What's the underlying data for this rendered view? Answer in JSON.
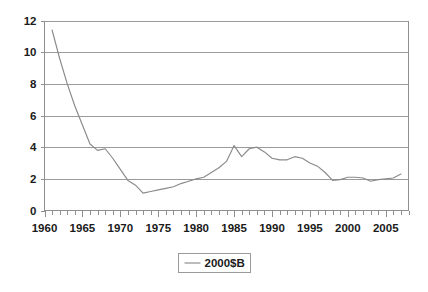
{
  "chart_data": {
    "type": "line",
    "title": "",
    "subtitle": "",
    "xlabel": "",
    "ylabel": "",
    "xlim": [
      1960,
      2008
    ],
    "ylim": [
      0,
      12
    ],
    "yticks": [
      "0",
      "2",
      "4",
      "6",
      "8",
      "10",
      "12"
    ],
    "ytick_values": [
      0,
      2,
      4,
      6,
      8,
      10,
      12
    ],
    "xticks": [
      "1960",
      "1965",
      "1970",
      "1975",
      "1980",
      "1985",
      "1990",
      "1995",
      "2000",
      "2005"
    ],
    "xtick_values": [
      1960,
      1965,
      1970,
      1975,
      1980,
      1985,
      1990,
      1995,
      2000,
      2005
    ],
    "minor_xtick_interval": 1,
    "grid": "horizontal",
    "legend_position": "bottom",
    "legend_entries": [
      "2000$B"
    ],
    "series": [
      {
        "name": "2000$B",
        "color": "#8a8a8a",
        "x": [
          1961,
          1962,
          1963,
          1964,
          1965,
          1966,
          1967,
          1968,
          1969,
          1970,
          1971,
          1972,
          1973,
          1974,
          1975,
          1976,
          1977,
          1978,
          1979,
          1980,
          1981,
          1982,
          1983,
          1984,
          1985,
          1986,
          1987,
          1988,
          1989,
          1990,
          1991,
          1992,
          1993,
          1994,
          1995,
          1996,
          1997,
          1998,
          1999,
          2000,
          2001,
          2002,
          2003,
          2004,
          2005,
          2006,
          2007
        ],
        "values": [
          11.4,
          9.6,
          8.0,
          6.6,
          5.4,
          4.2,
          3.8,
          3.9,
          3.3,
          2.6,
          1.9,
          1.6,
          1.1,
          1.2,
          1.3,
          1.4,
          1.5,
          1.7,
          1.85,
          2.0,
          2.1,
          2.4,
          2.7,
          3.1,
          4.1,
          3.4,
          3.9,
          4.0,
          3.7,
          3.3,
          3.2,
          3.2,
          3.4,
          3.3,
          3.0,
          2.8,
          2.4,
          1.9,
          1.95,
          2.1,
          2.1,
          2.05,
          1.85,
          1.95,
          2.0,
          2.05,
          2.3
        ]
      }
    ]
  },
  "legend": {
    "entry_label": "2000$B"
  },
  "axes": {
    "y_labels": [
      "12",
      "10",
      "8",
      "6",
      "4",
      "2",
      "0"
    ],
    "x_labels": [
      "1960",
      "1965",
      "1970",
      "1975",
      "1980",
      "1985",
      "1990",
      "1995",
      "2000",
      "2005"
    ]
  },
  "colors": {
    "series": "#8a8a8a",
    "gridline": "#9a9a9a",
    "axis": "#8f8f8f",
    "text": "#1b1b1b",
    "background": "#ffffff"
  }
}
